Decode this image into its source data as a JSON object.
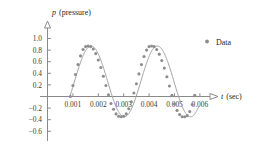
{
  "chart_data": {
    "type": "scatter",
    "title": "",
    "xlabel": "t (sec)",
    "xlabel_symbol": "t",
    "xlabel_unit": "(sec)",
    "ylabel": "p (pressure)",
    "ylabel_symbol": "p",
    "ylabel_unit": "(pressure)",
    "grid": false,
    "legend_position": "top-right",
    "xlim": [
      0.0,
      0.00655
    ],
    "ylim": [
      -0.72,
      1.12
    ],
    "xticks": [
      0.001,
      0.002,
      0.003,
      0.004,
      0.005,
      0.006
    ],
    "xtick_labels": [
      "0.001",
      "0.002",
      "0.003",
      "0.004",
      "0.005",
      "0.006"
    ],
    "yticks": [
      1.0,
      0.8,
      0.6,
      0.4,
      0.2,
      -0.2,
      -0.4,
      -0.6
    ],
    "ytick_labels": [
      "1.0",
      "0.8",
      "0.6",
      "0.4",
      "0.2",
      "−0.2",
      "−0.4",
      "−0.6"
    ],
    "series": [
      {
        "name": "Data",
        "marker": "circle",
        "color": "#8d8d8d",
        "x": [
          0.0009,
          0.001,
          0.0011,
          0.0012,
          0.0013,
          0.0014,
          0.0015,
          0.0016,
          0.0017,
          0.0018,
          0.0019,
          0.002,
          0.0021,
          0.0022,
          0.0023,
          0.0024,
          0.0025,
          0.0026,
          0.0027,
          0.0028,
          0.0029,
          0.003,
          0.0031,
          0.0032,
          0.0033,
          0.0034,
          0.0035,
          0.0036,
          0.0037,
          0.0038,
          0.0039,
          0.004,
          0.0041,
          0.0042,
          0.0043,
          0.0044,
          0.0045,
          0.0046,
          0.0047,
          0.0048,
          0.0049,
          0.005,
          0.0051,
          0.0052,
          0.0053,
          0.0054,
          0.0055,
          0.0056,
          0.0057,
          0.0058
        ],
        "y": [
          0.0,
          0.19,
          0.38,
          0.55,
          0.7,
          0.81,
          0.86,
          0.87,
          0.86,
          0.82,
          0.74,
          0.63,
          0.5,
          0.35,
          0.19,
          0.03,
          -0.12,
          -0.22,
          -0.3,
          -0.34,
          -0.35,
          -0.34,
          -0.3,
          -0.21,
          -0.09,
          0.06,
          0.22,
          0.39,
          0.55,
          0.69,
          0.8,
          0.86,
          0.87,
          0.86,
          0.81,
          0.73,
          0.62,
          0.49,
          0.34,
          0.18,
          0.02,
          -0.13,
          -0.24,
          -0.31,
          -0.35,
          -0.35,
          -0.33,
          -0.26,
          -0.14,
          0.02
        ]
      }
    ],
    "fit_curve": {
      "name": "sinusoidal fit",
      "color": "#a0a0a0",
      "amplitude": 0.61,
      "vertical_shift": 0.26,
      "period": 0.00261,
      "x_start": 0.00088,
      "x_end": 0.00595
    },
    "legend": [
      {
        "label": "Data",
        "marker": "circle",
        "color": "#8d8d8d"
      }
    ]
  },
  "colors": {
    "axis": "#8a8a8a",
    "curve": "#a0a0a0",
    "marker": "#8d8d8d",
    "text": "#1f1f1f",
    "tick_text": "#3b3b3b",
    "background": "#ffffff"
  }
}
